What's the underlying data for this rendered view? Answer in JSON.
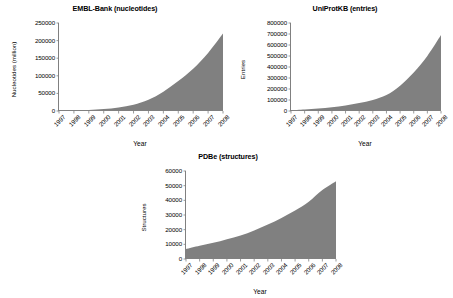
{
  "figure": {
    "background": "#ffffff",
    "series_fill_color": "#808080",
    "axis_color": "#808080"
  },
  "charts": [
    {
      "id": "embl-bank",
      "title": "EMBL-Bank (nucleotides)",
      "xlabel": "Year",
      "ylabel": "Nucleotides (million)",
      "yticks": [
        "250000",
        "200000",
        "150000",
        "100000",
        "50000",
        "0"
      ],
      "xticks": [
        "1997",
        "1998",
        "1999",
        "2000",
        "2001",
        "2002",
        "2003",
        "2004",
        "2005",
        "2006",
        "2007",
        "2008"
      ]
    },
    {
      "id": "uniprotkb",
      "title": "UniProtKB (entries)",
      "xlabel": "Year",
      "ylabel": "Entries",
      "yticks": [
        "800000",
        "700000",
        "600000",
        "500000",
        "400000",
        "300000",
        "200000",
        "100000",
        "0"
      ],
      "xticks": [
        "1997",
        "1998",
        "1999",
        "2000",
        "2001",
        "2002",
        "2003",
        "2004",
        "2005",
        "2006",
        "2007",
        "2008"
      ]
    },
    {
      "id": "pdbe",
      "title": "PDBe (structures)",
      "xlabel": "Year",
      "ylabel": "Structures",
      "yticks": [
        "60000",
        "50000",
        "40000",
        "30000",
        "20000",
        "10000",
        "0"
      ],
      "xticks": [
        "1997",
        "1998",
        "1999",
        "2000",
        "2001",
        "2002",
        "2003",
        "2004",
        "2005",
        "2006",
        "2007",
        "2008"
      ]
    }
  ],
  "chart_data": [
    {
      "type": "area",
      "id": "embl-bank",
      "title": "EMBL-Bank (nucleotides)",
      "xlabel": "Year",
      "ylabel": "Nucleotides (million)",
      "x": [
        1997,
        1998,
        1999,
        2000,
        2001,
        2002,
        2003,
        2004,
        2005,
        2006,
        2007,
        2008
      ],
      "values": [
        1000,
        1800,
        3000,
        5500,
        10000,
        18000,
        32000,
        55000,
        85000,
        120000,
        165000,
        220000
      ],
      "ylim": [
        0,
        250000
      ],
      "ytick_step": 50000,
      "grid": false,
      "legend": "none"
    },
    {
      "type": "area",
      "id": "uniprotkb",
      "title": "UniProtKB (entries)",
      "xlabel": "Year",
      "ylabel": "Entries",
      "x": [
        1997,
        1998,
        1999,
        2000,
        2001,
        2002,
        2003,
        2004,
        2005,
        2006,
        2007,
        2008
      ],
      "values": [
        8000,
        14000,
        22000,
        34000,
        50000,
        72000,
        100000,
        145000,
        230000,
        350000,
        500000,
        690000
      ],
      "ylim": [
        0,
        800000
      ],
      "ytick_step": 100000,
      "grid": false,
      "legend": "none"
    },
    {
      "type": "area",
      "id": "pdbe",
      "title": "PDBe (structures)",
      "xlabel": "Year",
      "ylabel": "Structures",
      "x": [
        1997,
        1998,
        1999,
        2000,
        2001,
        2002,
        2003,
        2004,
        2005,
        2006,
        2007,
        2008
      ],
      "values": [
        6800,
        9000,
        11000,
        13500,
        16000,
        19500,
        23500,
        28000,
        33000,
        39000,
        47000,
        53000
      ],
      "ylim": [
        0,
        60000
      ],
      "ytick_step": 10000,
      "grid": false,
      "legend": "none"
    }
  ]
}
